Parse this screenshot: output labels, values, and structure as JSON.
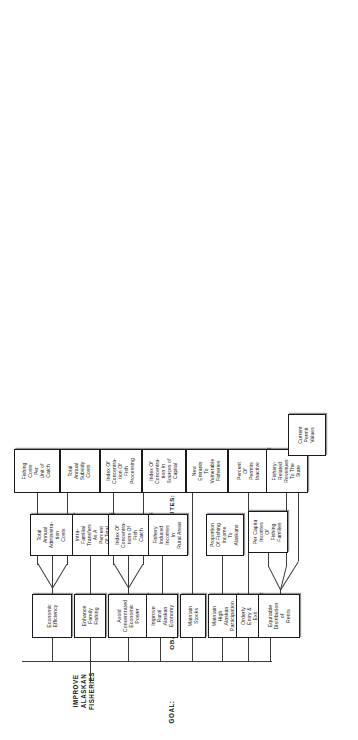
{
  "diagram": {
    "type": "objectives-hierarchy-tree",
    "orientation": "rotated-90-counterclockwise",
    "row_labels": {
      "goal": "GOAL:",
      "objectives": "OBJECTIVES:",
      "attributes": "ATTRIBUTES:"
    },
    "goal": {
      "label": "IMPROVE ALASKAN\nFISHERIES"
    },
    "objectives": [
      {
        "id": "economic-efficiency",
        "label": "Economic\nEfficiency"
      },
      {
        "id": "enhance-family-fishing",
        "label": "Enhance\nFamily\nFishing"
      },
      {
        "id": "avoid-concentrated-power",
        "label": "Avoid\nConcentrated\nEconomic\nPower"
      },
      {
        "id": "improve-rural-economy",
        "label": "Improve\nRural\nAlaskan\nEconomy"
      },
      {
        "id": "maintain-stocks",
        "label": "Maintain\nStocks"
      },
      {
        "id": "maintain-high-participation",
        "label": "Maintain\nHigh\nAlaskan\nParticipation"
      },
      {
        "id": "orderly-entry-exit",
        "label": "Orderly\nEntry &\nExit"
      },
      {
        "id": "equitable-distribution",
        "label": "Equitable\nDistribution\nof\nRents"
      }
    ],
    "attributes": [
      {
        "id": "fishing-costs-per-unit-of-catch",
        "label": "Fishing\nCosts\nPer\nUnit of\nCatch",
        "parent": "economic-efficiency"
      },
      {
        "id": "total-annual-administration-costs",
        "label": "Total\nAnnual\nAdministra-\ntion\nCosts",
        "parent": "economic-efficiency"
      },
      {
        "id": "total-annual-subsidy-costs",
        "label": "Total\nAnnual\nSubsidy\nCosts",
        "parent": "economic-efficiency"
      },
      {
        "id": "intra-familial-transfers",
        "label": "Intra-\nFamilial\nTransfers\nAs A\nPercent\nOf Total",
        "parent": "enhance-family-fishing"
      },
      {
        "id": "index-concentration-fish-processing",
        "label": "Index Of\nConcentra-\ntion Of\nFish\nProcessing",
        "parent": "avoid-concentrated-power"
      },
      {
        "id": "index-concentrations-fish-catch",
        "label": "Index Of\nConcentra-\ntions Of\nFish\nCatch",
        "parent": "avoid-concentrated-power"
      },
      {
        "id": "index-concentration-sources-capital",
        "label": "Index Of\nConcentra-\ntion In\nSources of\nCapital",
        "parent": "avoid-concentrated-power"
      },
      {
        "id": "fishery-induced-incomes-rural-areas",
        "label": "Fishery\nInduced\nIncomes\nIn\nRural Areas",
        "parent": "improve-rural-economy"
      },
      {
        "id": "new-entrants-vulnerable-fisheries",
        "label": "New\nEntrants\nTo\nVulnerable\nFisheries",
        "parent": "maintain-stocks"
      },
      {
        "id": "proportion-fishing-income-alaskans",
        "label": "Proportion\nOf Fishing\nIncome\nTo\nAlaskans",
        "parent": "maintain-high-participation"
      },
      {
        "id": "percent-permits-inactive",
        "label": "Percent\nOf\nPermits\nInactive",
        "parent": "orderly-entry-exit"
      },
      {
        "id": "per-capita-incomes-fishing-families",
        "label": "Per Capita\nIncomes\nOf\nFishing\nFamilies",
        "parent": "equitable-distribution"
      },
      {
        "id": "fishery-related-revenues-state",
        "label": "Fishery-\nRelated\nRevenues\nTo The\nState",
        "parent": "equitable-distribution"
      },
      {
        "id": "current-permit-values",
        "label": "Current\nPermit\nValues",
        "parent": "equitable-distribution"
      }
    ],
    "colors": {
      "box_border": "#1a1a1a",
      "line": "#3a3a3a",
      "background": "#ffffff",
      "text": "#1a1a1a"
    }
  }
}
